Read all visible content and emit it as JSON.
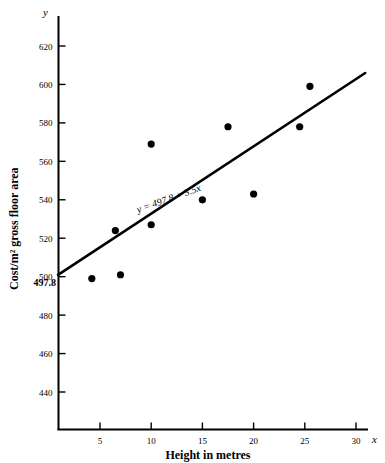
{
  "chart_data": {
    "type": "scatter",
    "title": "",
    "xlabel": "Height in metres",
    "ylabel": "Cost/m² gross floor area",
    "xlim": [
      0,
      31
    ],
    "ylim": [
      430,
      632
    ],
    "grid": false,
    "legend": "none",
    "x_ticks": [
      "5",
      "10",
      "15",
      "20",
      "25",
      "30"
    ],
    "x_tick_values": [
      5,
      10,
      15,
      20,
      25,
      30
    ],
    "y_ticks": [
      "440",
      "460",
      "480",
      "500",
      "520",
      "540",
      "560",
      "580",
      "600",
      "620"
    ],
    "y_tick_values": [
      440,
      460,
      480,
      500,
      520,
      540,
      560,
      580,
      600,
      620
    ],
    "y_special_tick": "497.8",
    "y_special_value": 497.8,
    "x_axis_symbol": "x",
    "y_axis_symbol": "y",
    "points": [
      {
        "x": 4.2,
        "y": 499
      },
      {
        "x": 6.5,
        "y": 524
      },
      {
        "x": 7.0,
        "y": 501
      },
      {
        "x": 10.0,
        "y": 527
      },
      {
        "x": 10.0,
        "y": 569
      },
      {
        "x": 15.0,
        "y": 540
      },
      {
        "x": 17.5,
        "y": 578
      },
      {
        "x": 20.0,
        "y": 543
      },
      {
        "x": 24.5,
        "y": 578
      },
      {
        "x": 25.5,
        "y": 599
      }
    ],
    "fit_line": {
      "equation": "y = 497.8 + 3.5x",
      "intercept": 497.8,
      "slope": 3.5,
      "x_start": 0.9,
      "x_end": 30.9
    },
    "annotation": "y = 497.8 + 3.5x"
  }
}
